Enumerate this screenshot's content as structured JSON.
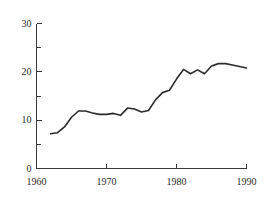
{
  "chart_data": {
    "type": "line",
    "title": "",
    "subtitle": "",
    "xlabel": "",
    "ylabel": "",
    "xlim": [
      1960,
      1990
    ],
    "ylim": [
      0,
      30
    ],
    "grid": false,
    "legend": null,
    "x_ticks": [
      1960,
      1970,
      1980,
      1990
    ],
    "x_tick_labels": [
      "1960",
      "1970",
      "1980",
      "1990"
    ],
    "x_minor_ticks": [
      1965,
      1975,
      1985
    ],
    "y_ticks": [
      0,
      10,
      20,
      30
    ],
    "y_tick_labels": [
      "0",
      "10",
      "20",
      "30"
    ],
    "y_minor_ticks": [
      5,
      15,
      25
    ],
    "series": [
      {
        "name": "series-1",
        "color": "#2b2b2b",
        "x": [
          1962,
          1963,
          1964,
          1965,
          1966,
          1967,
          1968,
          1969,
          1970,
          1971,
          1972,
          1973,
          1974,
          1975,
          1976,
          1977,
          1978,
          1979,
          1980,
          1981,
          1982,
          1983,
          1984,
          1985,
          1986,
          1987,
          1988,
          1989,
          1990
        ],
        "values": [
          7.2,
          7.4,
          8.6,
          10.6,
          11.9,
          11.9,
          11.5,
          11.2,
          11.2,
          11.4,
          11.0,
          12.5,
          12.3,
          11.7,
          12.0,
          14.2,
          15.7,
          16.2,
          18.5,
          20.5,
          19.6,
          20.4,
          19.6,
          21.2,
          21.7,
          21.7,
          21.4,
          21.1,
          20.8
        ]
      }
    ]
  },
  "axis": {
    "y_axis_name": "vertical-value-axis",
    "x_axis_name": "horizontal-year-axis"
  }
}
